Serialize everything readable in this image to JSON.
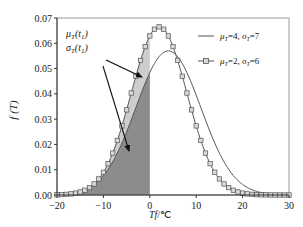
{
  "chart_data": {
    "type": "line",
    "title": "",
    "xlabel": "Tf/℃",
    "ylabel": "f (T)",
    "xlim": [
      -20,
      30
    ],
    "ylim": [
      0.0,
      0.07
    ],
    "x_ticks": [
      "-20",
      "-10",
      "0",
      "10",
      "20",
      "30"
    ],
    "y_ticks": [
      "0.00",
      "0.01",
      "0.02",
      "0.03",
      "0.04",
      "0.05",
      "0.06",
      "0.07"
    ],
    "grid": false,
    "legend_position": "upper right",
    "series": [
      {
        "name": "μT=4, σT=7",
        "style": "solid line",
        "mu": 4,
        "sigma": 7,
        "x": [
          -20,
          -15,
          -10,
          -5,
          0,
          4,
          5,
          10,
          15,
          20,
          25,
          30
        ],
        "values": [
          0.0015,
          0.0053,
          0.0135,
          0.025,
          0.0485,
          0.057,
          0.0565,
          0.0395,
          0.0166,
          0.0043,
          0.0006,
          0.0001
        ]
      },
      {
        "name": "μT=2, σT=6",
        "style": "line with square markers",
        "mu": 2,
        "sigma": 6,
        "x": [
          -20,
          -15,
          -10,
          -5,
          0,
          2,
          5,
          10,
          15,
          20,
          25,
          30
        ],
        "values": [
          0.0001,
          0.0012,
          0.009,
          0.0337,
          0.0629,
          0.0665,
          0.0587,
          0.0274,
          0.0064,
          0.0007,
          0.0,
          0.0
        ]
      }
    ],
    "shaded_regions": [
      {
        "name": "dark region",
        "description": "area under μT=4, σT=7 curve for Tf ≤ 0",
        "color": "#8a8a8a"
      },
      {
        "name": "light region",
        "description": "area between curves for Tf ≤ 0",
        "color": "#c8c8c8"
      }
    ],
    "annotations": [
      {
        "text_main": "μ",
        "sub": "T",
        "arg": "(t",
        "argsub": "1",
        "close": ")"
      },
      {
        "text_main": "σ",
        "sub": "T",
        "arg": "(t",
        "argsub": "1",
        "close": ")"
      }
    ]
  },
  "legend": {
    "item1": {
      "sym1": "μ",
      "sub1": "T",
      "val1": "=4, ",
      "sym2": "σ",
      "sub2": "T",
      "val2": "=7"
    },
    "item2": {
      "sym1": "μ",
      "sub1": "T",
      "val1": "=2, ",
      "sym2": "σ",
      "sub2": "T",
      "val2": "=6"
    }
  },
  "axes": {
    "xlabel_main": "Tf",
    "xlabel_unit": "/℃",
    "ylabel": "f (T)"
  },
  "colors": {
    "curve": "#555555",
    "marker_fill": "#d8d8d8",
    "dark_fill": "#8c8c8c",
    "light_fill": "#cdcdcd",
    "frame": "#555555"
  }
}
